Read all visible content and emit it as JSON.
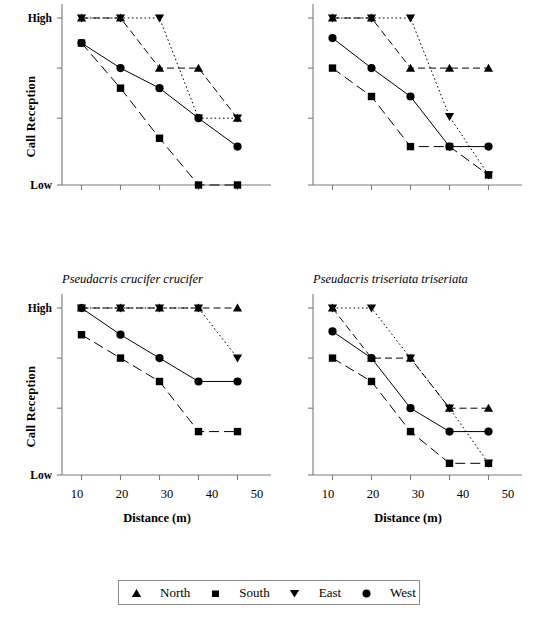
{
  "figure": {
    "axis_y_title": "Call Reception",
    "axis_x_title": "Distance (m)",
    "y_tick_high": "High",
    "y_tick_low": "Low",
    "x_ticks": [
      "10",
      "20",
      "30",
      "40",
      "50"
    ],
    "line_color": "#000000",
    "axis_color": "#7a7a7a"
  },
  "legend": {
    "entries": [
      {
        "label": "North",
        "marker": "triangle-up-icon"
      },
      {
        "label": "South",
        "marker": "square-icon"
      },
      {
        "label": "East",
        "marker": "triangle-down-icon"
      },
      {
        "label": "West",
        "marker": "circle-icon"
      }
    ]
  },
  "panels": [
    {
      "id": "top-left",
      "species": ""
    },
    {
      "id": "top-right",
      "species": ""
    },
    {
      "id": "bottom-left",
      "species": "Pseudacris crucifer crucifer"
    },
    {
      "id": "bottom-right",
      "species": "Pseudacris triseriata triseriata"
    }
  ],
  "chart_data": {
    "type": "line",
    "title": "",
    "xlabel": "Distance (m)",
    "ylabel": "Call Reception",
    "x": [
      10,
      20,
      30,
      40,
      50
    ],
    "xlim": [
      5,
      55
    ],
    "ylim": [
      0,
      10
    ],
    "ytick_values": [
      10,
      7,
      4,
      0
    ],
    "ytick_labels": [
      "High",
      "",
      "",
      "Low"
    ],
    "grid": false,
    "legend_position": "bottom",
    "legend_entries": [
      "North",
      "South",
      "East",
      "West"
    ],
    "series_styles": {
      "North": {
        "marker": "triangle-up",
        "line": "dashed"
      },
      "South": {
        "marker": "square",
        "line": "long-dash"
      },
      "East": {
        "marker": "triangle-down",
        "line": "dotted"
      },
      "West": {
        "marker": "circle",
        "line": "solid"
      }
    },
    "panels": [
      {
        "id": "top-left",
        "species": "",
        "series": [
          {
            "name": "North",
            "values": [
              10,
              10,
              7,
              7,
              4
            ]
          },
          {
            "name": "South",
            "values": [
              8.5,
              5.8,
              2.8,
              0,
              0
            ]
          },
          {
            "name": "East",
            "values": [
              10,
              10,
              10,
              4,
              4
            ]
          },
          {
            "name": "West",
            "values": [
              8.5,
              7,
              5.8,
              4,
              2.3
            ]
          }
        ]
      },
      {
        "id": "top-right",
        "species": "",
        "series": [
          {
            "name": "North",
            "values": [
              10,
              10,
              7,
              7,
              7
            ]
          },
          {
            "name": "South",
            "values": [
              7,
              5.3,
              2.3,
              2.3,
              0.6
            ]
          },
          {
            "name": "East",
            "values": [
              10,
              10,
              10,
              4.1,
              0.6
            ]
          },
          {
            "name": "West",
            "values": [
              8.8,
              7,
              5.3,
              2.3,
              2.3
            ]
          }
        ]
      },
      {
        "id": "bottom-left",
        "species": "Pseudacris crucifer crucifer",
        "series": [
          {
            "name": "North",
            "values": [
              10,
              10,
              10,
              10,
              10
            ]
          },
          {
            "name": "South",
            "values": [
              8.4,
              7,
              5.6,
              2.6,
              2.6
            ]
          },
          {
            "name": "East",
            "values": [
              10,
              10,
              10,
              10,
              7
            ]
          },
          {
            "name": "West",
            "values": [
              10,
              8.4,
              7,
              5.6,
              5.6
            ]
          }
        ]
      },
      {
        "id": "bottom-right",
        "species": "Pseudacris triseriata triseriata",
        "series": [
          {
            "name": "North",
            "values": [
              10,
              7,
              7,
              4,
              4
            ]
          },
          {
            "name": "South",
            "values": [
              7,
              5.6,
              2.6,
              0.7,
              0.7
            ]
          },
          {
            "name": "East",
            "values": [
              10,
              10,
              7,
              4,
              0.7
            ]
          },
          {
            "name": "West",
            "values": [
              8.6,
              7,
              4,
              2.6,
              2.6
            ]
          }
        ]
      }
    ]
  }
}
